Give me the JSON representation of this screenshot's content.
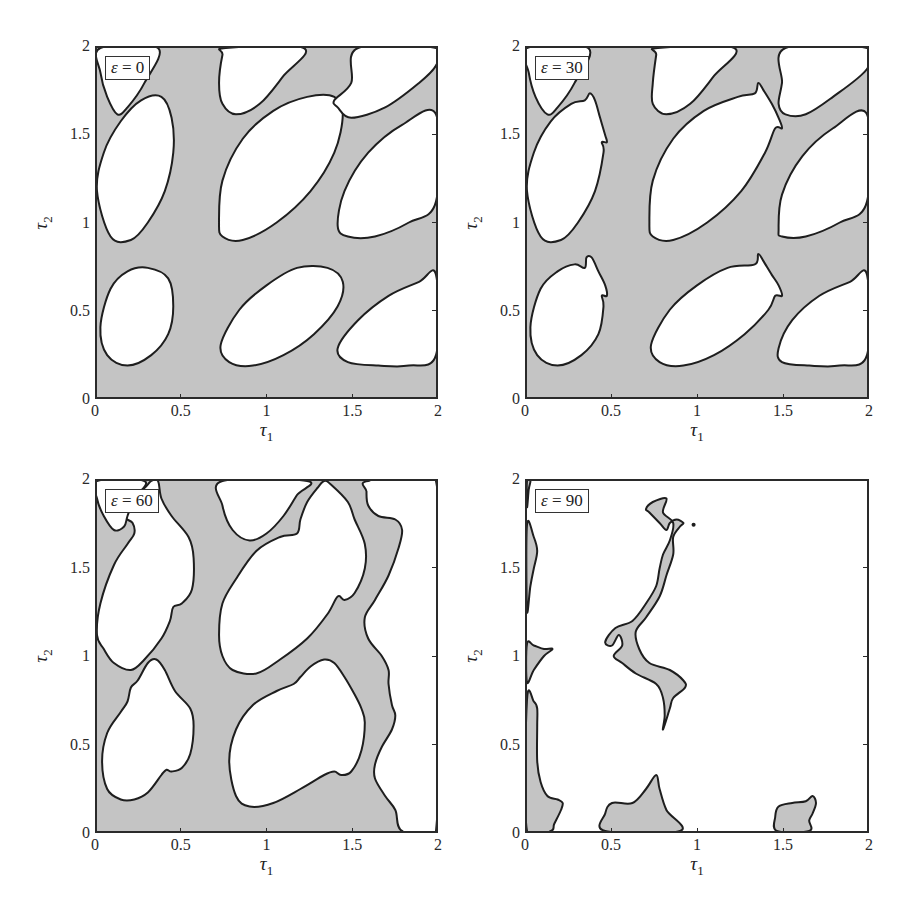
{
  "figure": {
    "xlabel": "τ",
    "xlabel_sub": "1",
    "ylabel": "τ",
    "ylabel_sub": "2",
    "xticks": [
      "0",
      "0.5",
      "1",
      "1.5",
      "2"
    ],
    "yticks": [
      "0",
      "0.5",
      "1",
      "1.5",
      "2"
    ],
    "fill_color": "#c4c4c4",
    "line_color": "#1e1e1e",
    "background_color": "#ffffff"
  },
  "panels": [
    {
      "id": "eps0",
      "legend_symbol": "ε",
      "legend_eq": " = ",
      "legend_value": "0"
    },
    {
      "id": "eps30",
      "legend_symbol": "ε",
      "legend_eq": " = ",
      "legend_value": "30"
    },
    {
      "id": "eps60",
      "legend_symbol": "ε",
      "legend_eq": " = ",
      "legend_value": "60"
    },
    {
      "id": "eps90",
      "legend_symbol": "ε",
      "legend_eq": " = ",
      "legend_value": "90"
    }
  ],
  "chart_data": [
    {
      "type": "contour",
      "title": "ε = 0",
      "xlabel": "τ1",
      "ylabel": "τ2",
      "xlim": [
        0,
        2
      ],
      "ylim": [
        0,
        2
      ],
      "xticks": [
        0,
        0.5,
        1,
        1.5,
        2
      ],
      "yticks": [
        0,
        0.5,
        1,
        1.5,
        2
      ],
      "grid": false,
      "description": "Gray shaded (stable) region with white elliptical holes tilted along the diagonal",
      "white_regions": [
        {
          "center": [
            0.27,
            0.47
          ],
          "note": "ellipse, τ1≈0–0.45, τ2≈0.18–0.75"
        },
        {
          "center": [
            0.27,
            1.3
          ],
          "note": "ellipse, τ1≈0–0.45, τ2≈0.9–1.72"
        },
        {
          "center": [
            0.06,
            1.85
          ],
          "note": "partial ellipse at top-left corner"
        },
        {
          "center": [
            1.05,
            0.47
          ],
          "note": "ellipse, τ1≈0.72–1.45, τ2≈0.18–0.75"
        },
        {
          "center": [
            1.08,
            1.3
          ],
          "note": "ellipse, τ1≈0.72–1.45, τ2≈0.9–1.72"
        },
        {
          "center": [
            1.0,
            1.85
          ],
          "note": "partial ellipse at top, τ1≈0.72–1.22"
        },
        {
          "center": [
            1.75,
            0.45
          ],
          "note": "partial ellipse at right edge, τ1≈1.42–2, τ2≈0.18–0.7"
        },
        {
          "center": [
            1.75,
            1.3
          ],
          "note": "partial ellipse at right edge, τ1≈1.42–2, τ2≈0.9–1.6"
        },
        {
          "center": [
            1.75,
            1.9
          ],
          "note": "partial region at top-right, τ1≈1.42–2"
        }
      ]
    },
    {
      "type": "contour",
      "title": "ε = 30",
      "xlabel": "τ1",
      "ylabel": "τ2",
      "xlim": [
        0,
        2
      ],
      "ylim": [
        0,
        2
      ],
      "xticks": [
        0,
        0.5,
        1,
        1.5,
        2
      ],
      "yticks": [
        0,
        0.5,
        1,
        1.5,
        2
      ],
      "grid": false,
      "description": "Same pattern as ε=0 with small notched protrusions at the upper-right ends of the ellipses"
    },
    {
      "type": "contour",
      "title": "ε = 60",
      "xlabel": "τ1",
      "ylabel": "τ2",
      "xlim": [
        0,
        2
      ],
      "ylim": [
        0,
        2
      ],
      "xticks": [
        0,
        0.5,
        1,
        1.5,
        2
      ],
      "yticks": [
        0,
        0.5,
        1,
        1.5,
        2
      ],
      "grid": false,
      "description": "White regions grow and become irregular; gray region bounded on the right by a wavy boundary near τ1≈1.6–1.8, white beyond"
    },
    {
      "type": "contour",
      "title": "ε = 90",
      "xlabel": "τ1",
      "ylabel": "τ2",
      "xlim": [
        0,
        2
      ],
      "ylim": [
        0,
        2
      ],
      "xticks": [
        0,
        0.5,
        1,
        1.5,
        2
      ],
      "yticks": [
        0,
        0.5,
        1,
        1.5,
        2
      ],
      "grid": false,
      "description": "Mostly white; small gray islands: left edge strips (τ2≈0–0.75, 0.85–1.05, 1.25–1.75), a zigzag strip near τ1≈0.45–0.92, τ2≈0.55–1.88, bottom blobs near τ1≈0.45–0.9 and τ1≈1.45–1.68, plus a dot at (0.98, 1.75)"
    }
  ]
}
